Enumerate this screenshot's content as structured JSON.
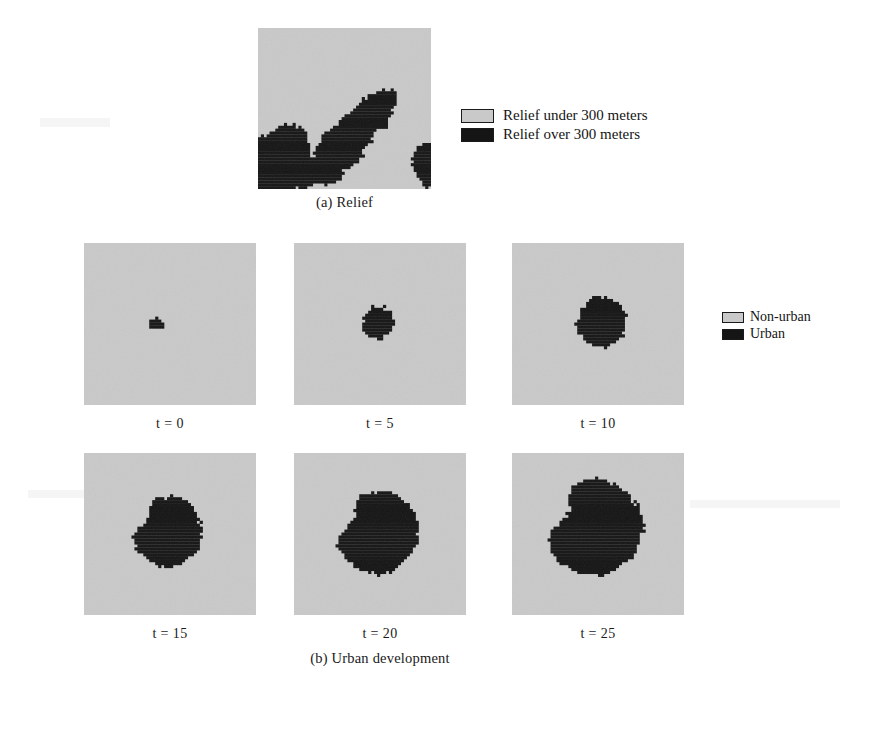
{
  "figure": {
    "background_color": "#ffffff",
    "nonurban_color": "#c9c9c9",
    "urban_color": "#151515",
    "relief_low_color": "#c9c9c9",
    "relief_high_color": "#151515"
  },
  "relief_section": {
    "caption": "(a) Relief",
    "panel_name": "relief-map",
    "legend": [
      {
        "label": "Relief under 300 meters",
        "color": "#c9c9c9"
      },
      {
        "label": "Relief over 300 meters",
        "color": "#151515"
      }
    ]
  },
  "urban_section": {
    "caption": "(b) Urban development",
    "legend": [
      {
        "label": "Non-urban",
        "color": "#c9c9c9"
      },
      {
        "label": "Urban",
        "color": "#151515"
      }
    ],
    "panels": [
      {
        "label": "t = 0",
        "step": 0
      },
      {
        "label": "t = 5",
        "step": 5
      },
      {
        "label": "t = 10",
        "step": 10
      },
      {
        "label": "t = 15",
        "step": 15
      },
      {
        "label": "t = 20",
        "step": 20
      },
      {
        "label": "t = 25",
        "step": 25
      }
    ]
  },
  "chart_data": {
    "type": "heatmap",
    "xlabel": "",
    "ylabel": "",
    "grid": false,
    "legend_position": "right",
    "maps": [
      {
        "name": "(a) Relief",
        "categories": [
          "Relief under 300 meters",
          "Relief over 300 meters"
        ],
        "colors": [
          "#c9c9c9",
          "#151515"
        ],
        "approx_high_relief_fraction": 0.17,
        "description": "Raster grid; black high-relief cells form a band running from lower-left corner diagonally up toward upper-right, plus a small patch at the right edge."
      },
      {
        "name": "(b) Urban development",
        "categories": [
          "Non-urban",
          "Urban"
        ],
        "colors": [
          "#c9c9c9",
          "#151515"
        ],
        "x": [
          0,
          5,
          10,
          15,
          20,
          25
        ],
        "xlabel": "t",
        "series": [
          {
            "name": "Urban fraction of grid",
            "values": [
              0.004,
              0.022,
              0.055,
              0.115,
              0.155,
              0.205
            ]
          },
          {
            "name": "Urban blob radius (fraction of panel width)",
            "values": [
              0.035,
              0.085,
              0.135,
              0.195,
              0.225,
              0.26
            ]
          }
        ]
      }
    ]
  }
}
